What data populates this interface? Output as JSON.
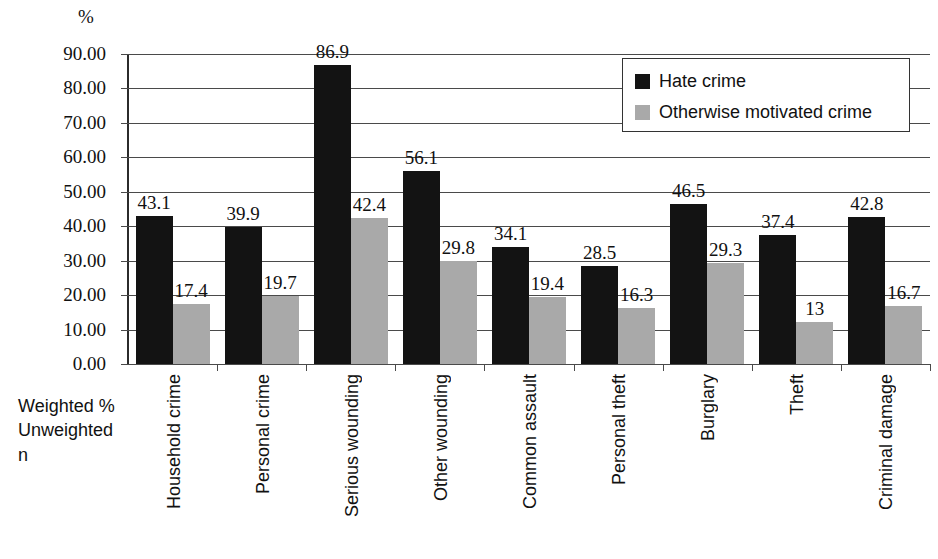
{
  "chart_data": {
    "type": "bar",
    "title": "",
    "subtitle": "",
    "xlabel": "",
    "ylabel": "%",
    "ylim": [
      0,
      90
    ],
    "ytick_step": 10,
    "grid": true,
    "legend_position": "top-right",
    "axis_note_lines": [
      "Weighted %",
      "Unweighted n"
    ],
    "ytick_labels": [
      "90.00",
      "80.00",
      "70.00",
      "60.00",
      "50.00",
      "40.00",
      "30.00",
      "20.00",
      "10.00",
      "0.00"
    ],
    "ytick_values": [
      90,
      80,
      70,
      60,
      50,
      40,
      30,
      20,
      10,
      0
    ],
    "categories": [
      "Household crime",
      "Personal crime",
      "Serious wounding",
      "Other wounding",
      "Common assault",
      "Personal theft",
      "Burglary",
      "Theft",
      "Criminal damage"
    ],
    "series": [
      {
        "name": "Hate crime",
        "color": "#131313",
        "values": [
          43.1,
          39.9,
          86.9,
          56.1,
          34.1,
          28.5,
          46.5,
          37.4,
          42.8
        ],
        "labels": [
          "43.1",
          "39.9",
          "86.9",
          "56.1",
          "34.1",
          "28.5",
          "46.5",
          "37.4",
          "42.8"
        ]
      },
      {
        "name": "Otherwise motivated crime",
        "color": "#a9a9a9",
        "values": [
          17.4,
          19.7,
          42.4,
          29.8,
          19.4,
          16.3,
          29.3,
          12.2,
          16.7
        ],
        "labels": [
          "17.4",
          "19.7",
          "42.4",
          "29.8",
          "19.4",
          "16.3",
          "29.3",
          "13",
          "16.7"
        ]
      }
    ]
  },
  "legend": {
    "items": [
      {
        "label": "Hate crime",
        "color": "#131313"
      },
      {
        "label": "Otherwise motivated crime",
        "color": "#a9a9a9"
      }
    ]
  }
}
